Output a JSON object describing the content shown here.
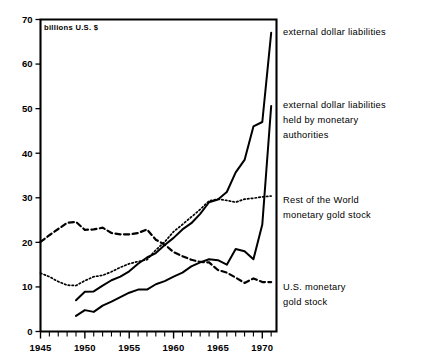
{
  "chart_data": {
    "type": "line",
    "title": "",
    "subtitle": "",
    "units_note": "billions U.S. $",
    "xlabel": "",
    "ylabel": "",
    "xlim": [
      1945,
      1971.6
    ],
    "ylim": [
      0,
      70
    ],
    "yticks": [
      0,
      10,
      20,
      30,
      40,
      50,
      60,
      70
    ],
    "ytick_labels": [
      "0",
      "10",
      "20",
      "30",
      "40",
      "50",
      "60",
      "70"
    ],
    "xticks": [
      1945,
      1946,
      1947,
      1948,
      1949,
      1950,
      1951,
      1952,
      1953,
      1954,
      1955,
      1956,
      1957,
      1958,
      1959,
      1960,
      1961,
      1962,
      1963,
      1964,
      1965,
      1966,
      1967,
      1968,
      1969,
      1970,
      1971
    ],
    "xtick_labels_shown": [
      "1945",
      "1950",
      "1955",
      "1960",
      "1965",
      "1970"
    ],
    "xtick_label_years": [
      1945,
      1950,
      1955,
      1960,
      1965,
      1970
    ],
    "grid": false,
    "legend_position": "right-inline-annotations",
    "series": [
      {
        "name": "external dollar liabilities",
        "style": "solid",
        "annotation": "external dollar liabilities",
        "x": [
          1949,
          1950,
          1951,
          1952,
          1953,
          1954,
          1955,
          1956,
          1957,
          1958,
          1959,
          1960,
          1961,
          1962,
          1963,
          1964,
          1965,
          1966,
          1967,
          1968,
          1969,
          1970,
          1971
        ],
        "values": [
          7.0,
          8.9,
          9.0,
          10.3,
          11.5,
          12.3,
          13.5,
          15.2,
          16.6,
          17.6,
          19.4,
          21.0,
          22.9,
          24.3,
          26.4,
          29.0,
          29.6,
          31.3,
          35.7,
          38.5,
          46.0,
          47.0,
          67.0
        ]
      },
      {
        "name": "external dollar liabilities held by monetary authorities",
        "style": "solid",
        "annotation": "external dollar liabilities held by monetary authorities",
        "x": [
          1949,
          1950,
          1951,
          1952,
          1953,
          1954,
          1955,
          1956,
          1957,
          1958,
          1959,
          1960,
          1961,
          1962,
          1963,
          1964,
          1965,
          1966,
          1967,
          1968,
          1969,
          1970,
          1971
        ],
        "values": [
          3.5,
          4.8,
          4.4,
          5.8,
          6.7,
          7.7,
          8.7,
          9.4,
          9.4,
          10.6,
          11.3,
          12.3,
          13.2,
          14.6,
          15.5,
          16.2,
          16.0,
          15.0,
          18.5,
          18.0,
          16.2,
          24.0,
          50.6
        ]
      },
      {
        "name": "Rest of the World monetary gold stock",
        "style": "dotted",
        "annotation": "Rest of the World monetary gold stock",
        "x": [
          1945,
          1946,
          1947,
          1948,
          1949,
          1950,
          1951,
          1952,
          1953,
          1954,
          1955,
          1956,
          1957,
          1958,
          1959,
          1960,
          1961,
          1962,
          1963,
          1964,
          1965,
          1966,
          1967,
          1968,
          1969,
          1970,
          1971
        ],
        "values": [
          13.1,
          12.3,
          11.2,
          10.4,
          10.3,
          11.4,
          12.3,
          12.6,
          13.4,
          14.4,
          15.2,
          15.7,
          16.1,
          18.3,
          20.1,
          22.4,
          24.0,
          25.7,
          27.4,
          29.3,
          29.7,
          29.4,
          29.0,
          29.7,
          29.9,
          30.2,
          30.4
        ]
      },
      {
        "name": "U.S. monetary gold stock",
        "style": "dashed",
        "annotation": "U.S. monetary gold stock",
        "x": [
          1945,
          1946,
          1947,
          1948,
          1949,
          1950,
          1951,
          1952,
          1953,
          1954,
          1955,
          1956,
          1957,
          1958,
          1959,
          1960,
          1961,
          1962,
          1963,
          1964,
          1965,
          1966,
          1967,
          1968,
          1969,
          1970,
          1971
        ],
        "values": [
          20.1,
          21.6,
          23.0,
          24.4,
          24.6,
          22.8,
          22.9,
          23.3,
          22.1,
          21.8,
          21.8,
          22.1,
          22.9,
          20.6,
          19.5,
          17.8,
          16.9,
          16.1,
          15.6,
          15.5,
          13.8,
          13.2,
          12.1,
          10.9,
          11.9,
          11.1,
          11.1
        ]
      }
    ]
  },
  "annotations": {
    "label1": "external dollar liabilities",
    "label2_line1": "external dollar liabilities",
    "label2_line2": "held by monetary",
    "label2_line3": "authorities",
    "label3_line1": "Rest of the World",
    "label3_line2": "monetary gold stock",
    "label4_line1": "U.S. monetary",
    "label4_line2": "gold stock"
  },
  "axes": {
    "units": "billions U.S. $",
    "y_labels": [
      "70",
      "60",
      "50",
      "40",
      "30",
      "20",
      "10",
      "0"
    ],
    "x_labels": [
      "1945",
      "1950",
      "1955",
      "1960",
      "1965",
      "1970"
    ]
  },
  "colors": {
    "ink": "#000000",
    "background": "#ffffff"
  }
}
